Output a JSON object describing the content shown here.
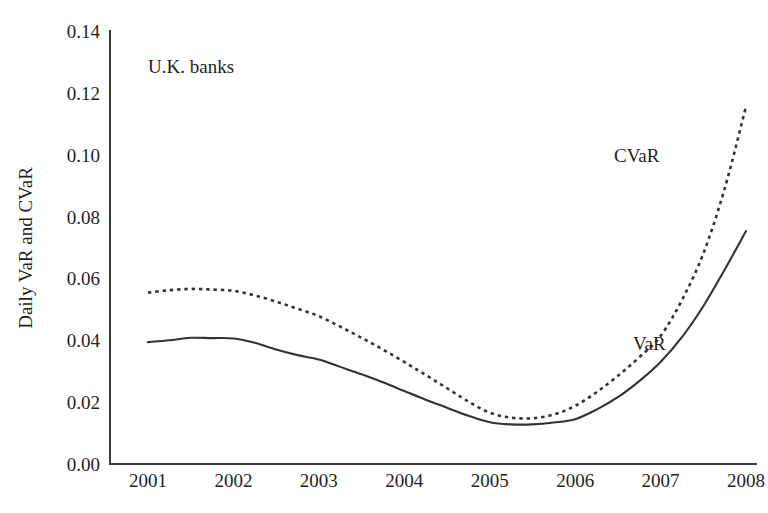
{
  "chart_data": {
    "type": "line",
    "title": "",
    "annotation": "U.K. banks",
    "xlabel": "",
    "ylabel": "Daily VaR and CVaR",
    "x": [
      2001,
      2002,
      2003,
      2004,
      2005,
      2006,
      2007,
      2008
    ],
    "xtick_labels": [
      "2001",
      "2002",
      "2003",
      "2004",
      "2005",
      "2006",
      "2007",
      "2008"
    ],
    "ytick_labels": [
      "0.00",
      "0.02",
      "0.04",
      "0.06",
      "0.08",
      "0.10",
      "0.12",
      "0.14"
    ],
    "ytick_values": [
      0.0,
      0.02,
      0.04,
      0.06,
      0.08,
      0.1,
      0.12,
      0.14
    ],
    "xlim": [
      2001,
      2008
    ],
    "ylim": [
      0.0,
      0.14
    ],
    "grid": false,
    "legend_position": "inline-labels",
    "series": [
      {
        "name": "VaR",
        "style": "solid",
        "color": "#333333",
        "label_text": "VaR",
        "values": [
          0.0394,
          0.0406,
          0.0338,
          0.0236,
          0.0135,
          0.0145,
          0.033,
          0.0753
        ],
        "points": [
          [
            2001.0,
            0.0394
          ],
          [
            2001.25,
            0.04
          ],
          [
            2001.5,
            0.0408
          ],
          [
            2001.75,
            0.0407
          ],
          [
            2002.0,
            0.0406
          ],
          [
            2002.25,
            0.0392
          ],
          [
            2002.5,
            0.037
          ],
          [
            2002.75,
            0.0352
          ],
          [
            2003.0,
            0.0338
          ],
          [
            2003.25,
            0.0314
          ],
          [
            2003.5,
            0.029
          ],
          [
            2003.75,
            0.0264
          ],
          [
            2004.0,
            0.0236
          ],
          [
            2004.25,
            0.0208
          ],
          [
            2004.5,
            0.0182
          ],
          [
            2004.75,
            0.0156
          ],
          [
            2005.0,
            0.0135
          ],
          [
            2005.25,
            0.0128
          ],
          [
            2005.5,
            0.0128
          ],
          [
            2005.75,
            0.0134
          ],
          [
            2006.0,
            0.0145
          ],
          [
            2006.25,
            0.0176
          ],
          [
            2006.5,
            0.0216
          ],
          [
            2006.75,
            0.0268
          ],
          [
            2007.0,
            0.033
          ],
          [
            2007.25,
            0.041
          ],
          [
            2007.5,
            0.051
          ],
          [
            2007.75,
            0.0628
          ],
          [
            2008.0,
            0.0753
          ]
        ]
      },
      {
        "name": "CVaR",
        "style": "dotted",
        "color": "#333333",
        "label_text": "CVaR",
        "values": [
          0.0554,
          0.056,
          0.0478,
          0.033,
          0.0166,
          0.0188,
          0.0414,
          0.1156
        ],
        "points": [
          [
            2001.0,
            0.0554
          ],
          [
            2001.25,
            0.0562
          ],
          [
            2001.5,
            0.0566
          ],
          [
            2001.75,
            0.0564
          ],
          [
            2002.0,
            0.056
          ],
          [
            2002.25,
            0.0545
          ],
          [
            2002.5,
            0.0525
          ],
          [
            2002.75,
            0.0502
          ],
          [
            2003.0,
            0.0478
          ],
          [
            2003.25,
            0.0444
          ],
          [
            2003.5,
            0.0408
          ],
          [
            2003.75,
            0.037
          ],
          [
            2004.0,
            0.033
          ],
          [
            2004.25,
            0.0288
          ],
          [
            2004.5,
            0.0245
          ],
          [
            2004.75,
            0.0202
          ],
          [
            2005.0,
            0.0166
          ],
          [
            2005.25,
            0.015
          ],
          [
            2005.5,
            0.0148
          ],
          [
            2005.75,
            0.016
          ],
          [
            2006.0,
            0.0188
          ],
          [
            2006.25,
            0.0232
          ],
          [
            2006.5,
            0.0285
          ],
          [
            2006.75,
            0.0345
          ],
          [
            2007.0,
            0.0414
          ],
          [
            2007.25,
            0.053
          ],
          [
            2007.5,
            0.068
          ],
          [
            2007.75,
            0.089
          ],
          [
            2008.0,
            0.1156
          ]
        ]
      }
    ]
  },
  "labels": {
    "cvar_inline": "CVaR",
    "var_inline": "VaR"
  }
}
